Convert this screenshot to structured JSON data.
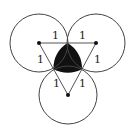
{
  "diagram": {
    "colors": {
      "stroke": "#444444",
      "fill_region": "#111111",
      "background": "#ffffff"
    },
    "circles": [
      {
        "id": "left",
        "cx": 39,
        "cy": 43,
        "r": 29
      },
      {
        "id": "right",
        "cx": 96,
        "cy": 43,
        "r": 29
      },
      {
        "id": "bottom",
        "cx": 68,
        "cy": 95,
        "r": 29
      }
    ],
    "labels": [
      {
        "text": "1",
        "x": 52,
        "y": 39
      },
      {
        "text": "1",
        "x": 79,
        "y": 39
      },
      {
        "text": "1",
        "x": 37,
        "y": 63
      },
      {
        "text": "1",
        "x": 94,
        "y": 63
      },
      {
        "text": "1",
        "x": 53,
        "y": 87
      },
      {
        "text": "1",
        "x": 79,
        "y": 87
      }
    ]
  }
}
